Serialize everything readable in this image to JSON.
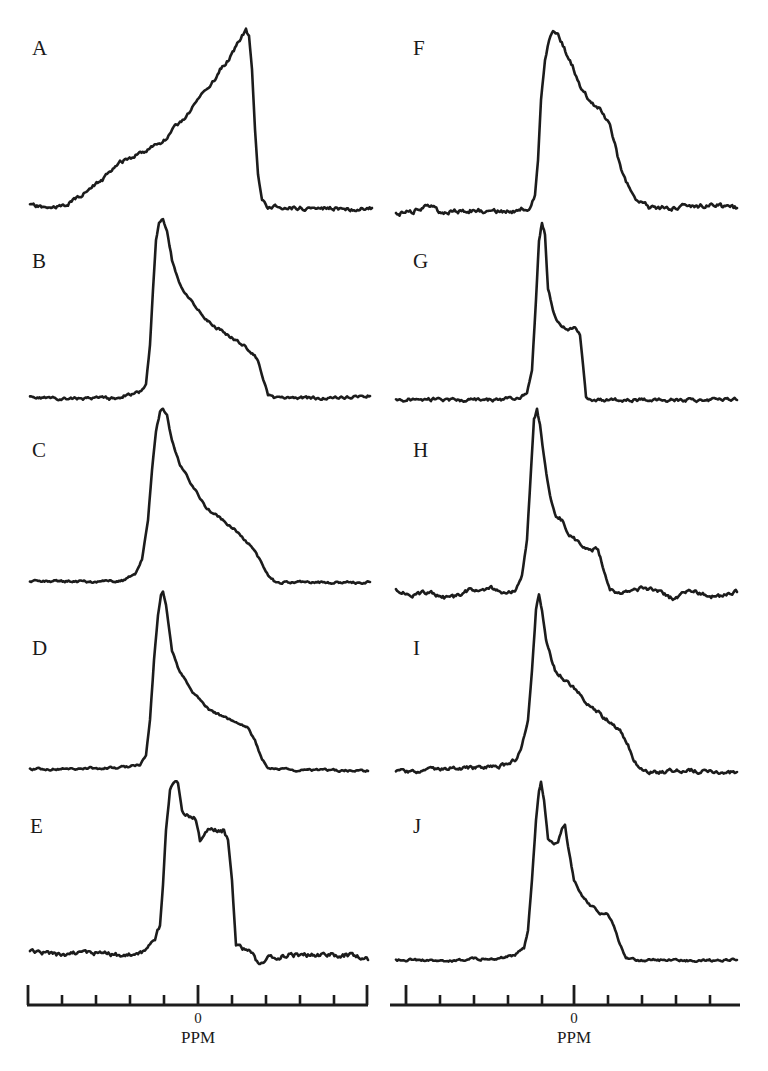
{
  "chart_data": {
    "type": "line",
    "title": "",
    "xlabel": "PPM",
    "ylabel": "",
    "grid": false,
    "legend": "none",
    "axes": [
      {
        "column": "left",
        "zero_label": "0",
        "unit_label": "PPM",
        "line": {
          "x1": 27,
          "x2": 368,
          "y": 1005
        },
        "major_ticks_x": [
          28,
          198,
          367
        ],
        "minor_ticks_x": [
          62,
          96,
          130,
          164,
          232,
          266,
          300,
          334
        ],
        "zero_x": 198
      },
      {
        "column": "right",
        "zero_label": "0",
        "unit_label": "PPM",
        "line": {
          "x1": 390,
          "x2": 740,
          "y": 1005
        },
        "major_ticks_x": [
          406,
          574
        ],
        "minor_ticks_x": [
          440,
          474,
          508,
          542,
          608,
          642,
          676,
          710
        ],
        "zero_x": 574
      }
    ],
    "series": [
      {
        "name": "A",
        "column": "left",
        "label_pos": [
          32,
          50
        ],
        "baseline_y": 207,
        "noise": 1.6,
        "seed": 11,
        "points": [
          [
            30,
            205
          ],
          [
            45,
            208
          ],
          [
            62,
            207
          ],
          [
            80,
            196
          ],
          [
            100,
            182
          ],
          [
            120,
            163
          ],
          [
            150,
            148
          ],
          [
            165,
            140
          ],
          [
            180,
            122
          ],
          [
            190,
            112
          ],
          [
            195,
            104
          ],
          [
            200,
            96
          ],
          [
            205,
            90
          ],
          [
            210,
            85
          ],
          [
            215,
            80
          ],
          [
            220,
            70
          ],
          [
            228,
            60
          ],
          [
            235,
            48
          ],
          [
            242,
            36
          ],
          [
            246,
            31
          ],
          [
            249,
            36
          ],
          [
            252,
            70
          ],
          [
            255,
            130
          ],
          [
            258,
            175
          ],
          [
            262,
            200
          ],
          [
            268,
            207
          ],
          [
            300,
            208
          ],
          [
            330,
            208
          ],
          [
            355,
            209
          ],
          [
            372,
            208
          ]
        ]
      },
      {
        "name": "B",
        "column": "left",
        "label_pos": [
          32,
          263
        ],
        "baseline_y": 398,
        "noise": 1.2,
        "seed": 23,
        "points": [
          [
            30,
            397
          ],
          [
            60,
            399
          ],
          [
            100,
            398
          ],
          [
            115,
            399
          ],
          [
            125,
            395
          ],
          [
            140,
            392
          ],
          [
            146,
            384
          ],
          [
            150,
            345
          ],
          [
            153,
            290
          ],
          [
            156,
            240
          ],
          [
            159,
            224
          ],
          [
            163,
            220
          ],
          [
            167,
            230
          ],
          [
            172,
            260
          ],
          [
            180,
            285
          ],
          [
            195,
            305
          ],
          [
            205,
            320
          ],
          [
            220,
            330
          ],
          [
            235,
            340
          ],
          [
            250,
            350
          ],
          [
            258,
            360
          ],
          [
            262,
            375
          ],
          [
            268,
            395
          ],
          [
            275,
            399
          ],
          [
            300,
            398
          ],
          [
            340,
            398
          ],
          [
            370,
            396
          ]
        ]
      },
      {
        "name": "C",
        "column": "left",
        "label_pos": [
          32,
          452
        ],
        "baseline_y": 582,
        "noise": 1.0,
        "seed": 37,
        "points": [
          [
            30,
            582
          ],
          [
            60,
            581
          ],
          [
            100,
            582
          ],
          [
            125,
            580
          ],
          [
            135,
            574
          ],
          [
            142,
            560
          ],
          [
            148,
            520
          ],
          [
            152,
            470
          ],
          [
            156,
            430
          ],
          [
            160,
            412
          ],
          [
            163,
            408
          ],
          [
            167,
            415
          ],
          [
            172,
            440
          ],
          [
            180,
            465
          ],
          [
            195,
            490
          ],
          [
            205,
            507
          ],
          [
            220,
            518
          ],
          [
            235,
            530
          ],
          [
            250,
            545
          ],
          [
            260,
            560
          ],
          [
            268,
            575
          ],
          [
            275,
            582
          ],
          [
            300,
            582
          ],
          [
            340,
            583
          ],
          [
            370,
            582
          ]
        ]
      },
      {
        "name": "D",
        "column": "left",
        "label_pos": [
          32,
          650
        ],
        "baseline_y": 770,
        "noise": 0.9,
        "seed": 41,
        "points": [
          [
            30,
            769
          ],
          [
            60,
            769
          ],
          [
            100,
            768
          ],
          [
            130,
            767
          ],
          [
            140,
            765
          ],
          [
            146,
            755
          ],
          [
            150,
            720
          ],
          [
            154,
            660
          ],
          [
            158,
            615
          ],
          [
            161,
            596
          ],
          [
            163,
            593
          ],
          [
            166,
            605
          ],
          [
            172,
            650
          ],
          [
            180,
            673
          ],
          [
            195,
            695
          ],
          [
            210,
            710
          ],
          [
            230,
            720
          ],
          [
            248,
            728
          ],
          [
            255,
            740
          ],
          [
            262,
            760
          ],
          [
            268,
            768
          ],
          [
            290,
            770
          ],
          [
            330,
            770
          ],
          [
            368,
            771
          ]
        ]
      },
      {
        "name": "E",
        "column": "left",
        "label_pos": [
          30,
          828
        ],
        "baseline_y": 955,
        "noise": 2.0,
        "seed": 53,
        "points": [
          [
            30,
            952
          ],
          [
            60,
            955
          ],
          [
            100,
            953
          ],
          [
            130,
            955
          ],
          [
            145,
            952
          ],
          [
            155,
            940
          ],
          [
            160,
            925
          ],
          [
            163,
            885
          ],
          [
            166,
            830
          ],
          [
            170,
            790
          ],
          [
            174,
            781
          ],
          [
            178,
            784
          ],
          [
            182,
            810
          ],
          [
            188,
            815
          ],
          [
            196,
            820
          ],
          [
            200,
            840
          ],
          [
            204,
            835
          ],
          [
            208,
            828
          ],
          [
            215,
            830
          ],
          [
            224,
            830
          ],
          [
            228,
            840
          ],
          [
            232,
            880
          ],
          [
            236,
            945
          ],
          [
            240,
            948
          ],
          [
            250,
            950
          ],
          [
            258,
            965
          ],
          [
            265,
            958
          ],
          [
            290,
            955
          ],
          [
            320,
            955
          ],
          [
            350,
            955
          ],
          [
            368,
            960
          ]
        ]
      },
      {
        "name": "F",
        "column": "right",
        "label_pos": [
          413,
          50
        ],
        "baseline_y": 210,
        "noise": 2.0,
        "seed": 61,
        "points": [
          [
            396,
            214
          ],
          [
            410,
            212
          ],
          [
            430,
            205
          ],
          [
            440,
            212
          ],
          [
            470,
            210
          ],
          [
            500,
            212
          ],
          [
            520,
            210
          ],
          [
            530,
            207
          ],
          [
            535,
            195
          ],
          [
            538,
            160
          ],
          [
            541,
            100
          ],
          [
            545,
            60
          ],
          [
            549,
            40
          ],
          [
            553,
            33
          ],
          [
            558,
            36
          ],
          [
            563,
            45
          ],
          [
            570,
            60
          ],
          [
            580,
            85
          ],
          [
            590,
            100
          ],
          [
            600,
            110
          ],
          [
            610,
            125
          ],
          [
            615,
            145
          ],
          [
            620,
            165
          ],
          [
            626,
            182
          ],
          [
            632,
            190
          ],
          [
            638,
            200
          ],
          [
            650,
            208
          ],
          [
            680,
            207
          ],
          [
            710,
            205
          ],
          [
            737,
            208
          ]
        ]
      },
      {
        "name": "G",
        "column": "right",
        "label_pos": [
          413,
          263
        ],
        "baseline_y": 400,
        "noise": 1.4,
        "seed": 71,
        "points": [
          [
            396,
            400
          ],
          [
            420,
            399
          ],
          [
            460,
            400
          ],
          [
            500,
            400
          ],
          [
            520,
            398
          ],
          [
            527,
            392
          ],
          [
            532,
            370
          ],
          [
            536,
            300
          ],
          [
            539,
            240
          ],
          [
            542,
            222
          ],
          [
            545,
            235
          ],
          [
            548,
            290
          ],
          [
            553,
            310
          ],
          [
            560,
            325
          ],
          [
            568,
            330
          ],
          [
            575,
            328
          ],
          [
            580,
            335
          ],
          [
            583,
            365
          ],
          [
            586,
            395
          ],
          [
            592,
            400
          ],
          [
            620,
            400
          ],
          [
            660,
            400
          ],
          [
            700,
            400
          ],
          [
            737,
            400
          ]
        ]
      },
      {
        "name": "H",
        "column": "right",
        "label_pos": [
          413,
          452
        ],
        "baseline_y": 592,
        "noise": 1.8,
        "seed": 83,
        "points": [
          [
            396,
            590
          ],
          [
            410,
            595
          ],
          [
            430,
            592
          ],
          [
            450,
            600
          ],
          [
            470,
            590
          ],
          [
            490,
            588
          ],
          [
            505,
            592
          ],
          [
            515,
            590
          ],
          [
            522,
            575
          ],
          [
            527,
            540
          ],
          [
            531,
            470
          ],
          [
            534,
            420
          ],
          [
            537,
            410
          ],
          [
            540,
            425
          ],
          [
            545,
            465
          ],
          [
            550,
            495
          ],
          [
            556,
            515
          ],
          [
            562,
            520
          ],
          [
            568,
            535
          ],
          [
            575,
            540
          ],
          [
            582,
            545
          ],
          [
            590,
            548
          ],
          [
            598,
            550
          ],
          [
            604,
            570
          ],
          [
            610,
            590
          ],
          [
            620,
            595
          ],
          [
            640,
            588
          ],
          [
            660,
            592
          ],
          [
            675,
            600
          ],
          [
            690,
            590
          ],
          [
            710,
            598
          ],
          [
            737,
            592
          ]
        ]
      },
      {
        "name": "I",
        "column": "right",
        "label_pos": [
          413,
          650
        ],
        "baseline_y": 772,
        "noise": 1.6,
        "seed": 97,
        "points": [
          [
            396,
            772
          ],
          [
            420,
            772
          ],
          [
            450,
            768
          ],
          [
            480,
            768
          ],
          [
            505,
            765
          ],
          [
            515,
            760
          ],
          [
            522,
            745
          ],
          [
            528,
            720
          ],
          [
            532,
            670
          ],
          [
            536,
            610
          ],
          [
            539,
            596
          ],
          [
            542,
            610
          ],
          [
            546,
            640
          ],
          [
            555,
            670
          ],
          [
            565,
            680
          ],
          [
            580,
            695
          ],
          [
            595,
            710
          ],
          [
            610,
            722
          ],
          [
            620,
            730
          ],
          [
            628,
            745
          ],
          [
            634,
            760
          ],
          [
            640,
            770
          ],
          [
            660,
            772
          ],
          [
            690,
            770
          ],
          [
            720,
            773
          ],
          [
            737,
            772
          ]
        ]
      },
      {
        "name": "J",
        "column": "right",
        "label_pos": [
          413,
          828
        ],
        "baseline_y": 960,
        "noise": 1.0,
        "seed": 107,
        "points": [
          [
            396,
            960
          ],
          [
            420,
            960
          ],
          [
            445,
            962
          ],
          [
            470,
            959
          ],
          [
            500,
            958
          ],
          [
            515,
            955
          ],
          [
            524,
            948
          ],
          [
            528,
            930
          ],
          [
            532,
            880
          ],
          [
            536,
            820
          ],
          [
            539,
            790
          ],
          [
            541,
            782
          ],
          [
            544,
            800
          ],
          [
            548,
            838
          ],
          [
            554,
            845
          ],
          [
            558,
            842
          ],
          [
            562,
            828
          ],
          [
            565,
            825
          ],
          [
            568,
            848
          ],
          [
            574,
            880
          ],
          [
            582,
            895
          ],
          [
            590,
            905
          ],
          [
            600,
            913
          ],
          [
            608,
            915
          ],
          [
            614,
            925
          ],
          [
            620,
            945
          ],
          [
            626,
            958
          ],
          [
            640,
            960
          ],
          [
            670,
            960
          ],
          [
            700,
            961
          ],
          [
            737,
            960
          ]
        ]
      }
    ]
  }
}
